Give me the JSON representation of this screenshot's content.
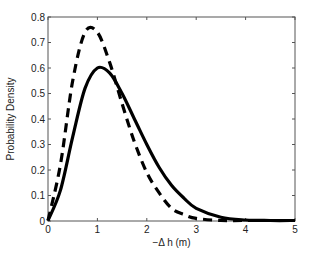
{
  "chart_data": {
    "type": "line",
    "title": "",
    "xlabel": "−Δ h (m)",
    "ylabel": "Probability Density",
    "xlim": [
      0,
      5
    ],
    "ylim": [
      0,
      0.8
    ],
    "grid": false,
    "legend": null,
    "xticks": [
      "0",
      "1",
      "2",
      "3",
      "4",
      "5"
    ],
    "yticks": [
      "0",
      "0.1",
      "0.2",
      "0.3",
      "0.4",
      "0.5",
      "0.6",
      "0.7",
      "0.8"
    ],
    "x": [
      0,
      0.25,
      0.5,
      0.75,
      1.0,
      1.25,
      1.5,
      1.75,
      2.0,
      2.25,
      2.5,
      2.75,
      3.0,
      3.5,
      4.0,
      4.5,
      5.0
    ],
    "series": [
      {
        "name": "solid",
        "style": "solid",
        "color": "#000000",
        "values": [
          0,
          0.12,
          0.33,
          0.52,
          0.6,
          0.58,
          0.5,
          0.4,
          0.3,
          0.21,
          0.14,
          0.09,
          0.05,
          0.015,
          0.004,
          0.001,
          0
        ]
      },
      {
        "name": "dashed",
        "style": "dashed",
        "color": "#000000",
        "values": [
          0,
          0.22,
          0.55,
          0.74,
          0.74,
          0.62,
          0.46,
          0.31,
          0.19,
          0.11,
          0.05,
          0.025,
          0.01,
          0.002,
          0,
          0,
          0
        ]
      }
    ]
  }
}
